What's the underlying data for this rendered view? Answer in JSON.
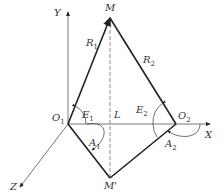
{
  "diagram": {
    "type": "geometric-coordinate-diagram",
    "axes": {
      "x_label": "X",
      "y_label": "Y",
      "z_label": "Z"
    },
    "points": {
      "M": {
        "label": "M"
      },
      "M_prime": {
        "label": "M'"
      },
      "O1": {
        "label": "O",
        "sub": "1"
      },
      "O2": {
        "label": "O",
        "sub": "2"
      },
      "L": {
        "label": "L"
      }
    },
    "segments": {
      "R1": {
        "label": "R",
        "sub": "1"
      },
      "R2": {
        "label": "R",
        "sub": "2"
      }
    },
    "angles": {
      "E1": {
        "label": "E",
        "sub": "1"
      },
      "E2": {
        "label": "E",
        "sub": "2"
      },
      "A1": {
        "label": "A",
        "sub": "1"
      },
      "A2": {
        "label": "A",
        "sub": "2"
      }
    },
    "colors": {
      "line": "#222222",
      "axis": "#555555",
      "dashed": "#777777"
    }
  }
}
